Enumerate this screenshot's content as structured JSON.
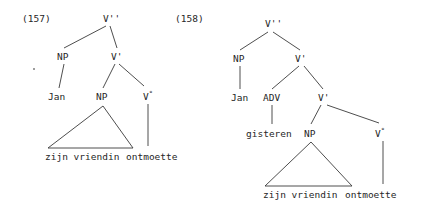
{
  "figure": {
    "width": 436,
    "height": 212,
    "background": "#ffffff",
    "ink_color": "#262626",
    "line_color": "#3a3a3a"
  },
  "examples": [
    {
      "id": "157",
      "number_label": "(157)",
      "number_pos": {
        "x": 22,
        "y": 14
      },
      "sentence": "Jan zijn vriendin ontmoette",
      "nodes": [
        {
          "key": "vmax",
          "label": "V''",
          "text": "V",
          "mark": "''",
          "x": 103,
          "y": 14
        },
        {
          "key": "np_subj",
          "label": "NP",
          "text": "NP",
          "mark": "",
          "x": 57,
          "y": 52
        },
        {
          "key": "vbar",
          "label": "V'",
          "text": "V",
          "mark": "'",
          "x": 111,
          "y": 52
        },
        {
          "key": "jan",
          "label": "Jan",
          "text": "Jan",
          "mark": "",
          "x": 48,
          "y": 92
        },
        {
          "key": "np_obj",
          "label": "NP",
          "text": "NP",
          "mark": "",
          "x": 96,
          "y": 92
        },
        {
          "key": "vzero",
          "label": "V°",
          "text": "V",
          "mark": "°",
          "x": 143,
          "y": 92
        }
      ],
      "terminals": [
        {
          "key": "t_zijn_vriendin",
          "label": "zijn vriendin",
          "x": 45,
          "y": 152
        },
        {
          "key": "t_ontmoette",
          "label": "ontmoette",
          "x": 126,
          "y": 152
        }
      ],
      "triangle": {
        "apex_x": 103,
        "apex_y": 106,
        "left_x": 48,
        "right_x": 133,
        "base_y": 148
      }
    },
    {
      "id": "158",
      "number_label": "(158)",
      "number_pos": {
        "x": 175,
        "y": 14
      },
      "sentence": "Jan gisteren zijn vriendin ontmoette",
      "nodes": [
        {
          "key": "vmax",
          "label": "V''",
          "text": "V",
          "mark": "''",
          "x": 265,
          "y": 19
        },
        {
          "key": "np_subj",
          "label": "NP",
          "text": "NP",
          "mark": "",
          "x": 233,
          "y": 54
        },
        {
          "key": "vbar_outer",
          "label": "V'",
          "text": "V",
          "mark": "'",
          "x": 295,
          "y": 54
        },
        {
          "key": "jan",
          "label": "Jan",
          "text": "Jan",
          "mark": "",
          "x": 231,
          "y": 93
        },
        {
          "key": "adv",
          "label": "ADV",
          "text": "ADV",
          "mark": "",
          "x": 263,
          "y": 93
        },
        {
          "key": "vbar_inner",
          "label": "V'",
          "text": "V",
          "mark": "'",
          "x": 318,
          "y": 93
        },
        {
          "key": "gisteren",
          "label": "gisteren",
          "x": 246,
          "y": 129
        },
        {
          "key": "np_obj",
          "label": "NP",
          "text": "NP",
          "mark": "",
          "x": 304,
          "y": 129
        },
        {
          "key": "vzero",
          "label": "V°",
          "text": "V",
          "mark": "°",
          "x": 375,
          "y": 129
        }
      ],
      "terminals": [
        {
          "key": "t_zijn_vriendin",
          "label": "zijn vriendin",
          "x": 263,
          "y": 190
        },
        {
          "key": "t_ontmoette",
          "label": "ontmoette",
          "x": 345,
          "y": 190
        }
      ],
      "triangle": {
        "apex_x": 311,
        "apex_y": 142,
        "left_x": 265,
        "right_x": 352,
        "base_y": 186
      }
    }
  ],
  "edges_157": [
    {
      "from": "V''",
      "to": "NP",
      "x1": 106,
      "y1": 26,
      "x2": 64,
      "y2": 48
    },
    {
      "from": "V''",
      "to": "V'",
      "x1": 110,
      "y1": 26,
      "x2": 117,
      "y2": 48
    },
    {
      "from": "NP",
      "to": "Jan",
      "x1": 64,
      "y1": 64,
      "x2": 59,
      "y2": 88
    },
    {
      "from": "V'",
      "to": "NP",
      "x1": 115,
      "y1": 64,
      "x2": 103,
      "y2": 88
    },
    {
      "from": "V'",
      "to": "V°",
      "x1": 119,
      "y1": 64,
      "x2": 144,
      "y2": 86
    },
    {
      "from": "V°",
      "to": "ontmoette",
      "x1": 148,
      "y1": 104,
      "x2": 148,
      "y2": 146
    }
  ],
  "edges_158": [
    {
      "from": "V''",
      "to": "NP",
      "x1": 268,
      "y1": 32,
      "x2": 240,
      "y2": 50
    },
    {
      "from": "V''",
      "to": "V'",
      "x1": 273,
      "y1": 32,
      "x2": 300,
      "y2": 50
    },
    {
      "from": "NP",
      "to": "Jan",
      "x1": 240,
      "y1": 66,
      "x2": 240,
      "y2": 89
    },
    {
      "from": "V'",
      "to": "ADV",
      "x1": 299,
      "y1": 66,
      "x2": 272,
      "y2": 89
    },
    {
      "from": "V'",
      "to": "V'",
      "x1": 304,
      "y1": 66,
      "x2": 323,
      "y2": 89
    },
    {
      "from": "ADV",
      "to": "gisteren",
      "x1": 272,
      "y1": 105,
      "x2": 272,
      "y2": 124
    },
    {
      "from": "V'",
      "to": "NP",
      "x1": 321,
      "y1": 105,
      "x2": 311,
      "y2": 124
    },
    {
      "from": "V'",
      "to": "V°",
      "x1": 327,
      "y1": 105,
      "x2": 379,
      "y2": 123
    },
    {
      "from": "V°",
      "to": "ontmoette",
      "x1": 383,
      "y1": 141,
      "x2": 383,
      "y2": 184
    }
  ],
  "artifacts": [
    {
      "key": "scan-speck",
      "x": 33,
      "y": 68
    }
  ]
}
